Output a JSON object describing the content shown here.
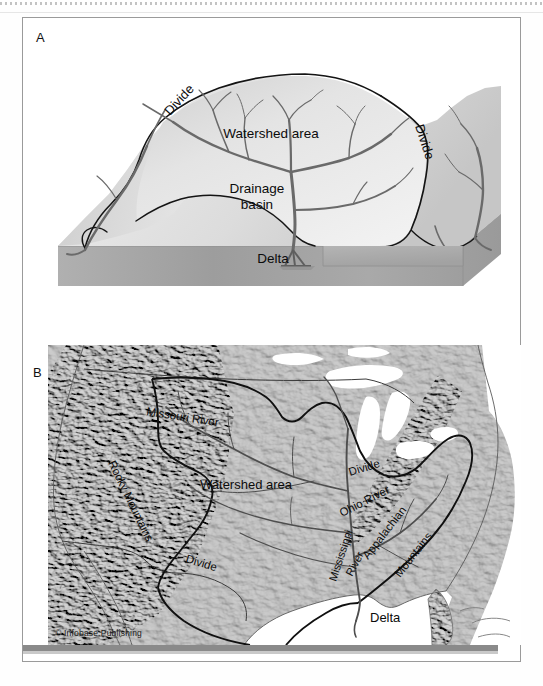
{
  "figure": {
    "copyright": "© Infobase Publishing",
    "panels": [
      {
        "letter": "A",
        "kind": "block-diagram"
      },
      {
        "letter": "B",
        "kind": "relief-map"
      }
    ]
  },
  "panel_a": {
    "letter": "A",
    "title_implied": "Drainage basin block diagram",
    "labels": {
      "divide_left": "Divide",
      "divide_right": "Divide",
      "watershed_area": "Watershed area",
      "drainage_basin_line1": "Drainage",
      "drainage_basin_line2": "basin",
      "delta": "Delta"
    }
  },
  "panel_b": {
    "letter": "B",
    "title_implied": "Mississippi River watershed of the United States",
    "labels": {
      "missouri_river": "Missouri River",
      "rocky_mountains": "Rocky Mountains",
      "watershed_area": "Watershed area",
      "divide_north": "Divide",
      "divide_south": "Divide",
      "ohio_river": "Ohio River",
      "appalachian_line1": "Appalachian",
      "appalachian_line2": "Mountains",
      "mississippi_line1": "Mississippi",
      "mississippi_line2": "River",
      "delta": "Delta"
    }
  },
  "colors": {
    "frame": "#9a9a9a",
    "label_text": "#0b0b0b",
    "river": "#5d5d5d",
    "divide_line": "#1b1b1b",
    "block_top": "#e9e9e9",
    "block_side": "#b5b5b5",
    "map_land": "#c2c2c2",
    "map_water": "#ffffff",
    "bottom_bar": "#8a8a8a"
  }
}
